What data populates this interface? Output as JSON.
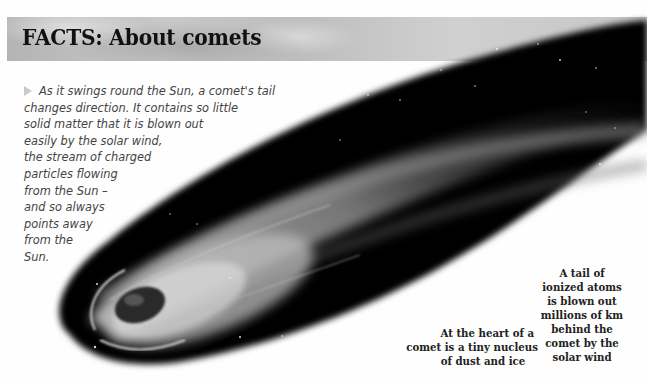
{
  "header": {
    "title": "FACTS: About comets"
  },
  "intro": {
    "marker_icon": "triangle-right-icon",
    "lines": [
      "As it swings round the Sun, a comet's tail",
      "changes direction. It contains so little",
      "solid matter that it is blown out",
      "easily by the solar wind,",
      "the stream of charged",
      "particles flowing",
      "from the Sun –",
      "and so always",
      "points away",
      "from the",
      "Sun."
    ]
  },
  "captions": {
    "nucleus": {
      "lines": [
        "At the heart of a",
        "comet is a tiny nucleus",
        "of dust and ice"
      ]
    },
    "tail": {
      "lines": [
        "A tail of",
        "ionized atoms",
        "is blown out",
        "millions of km",
        "behind the",
        "comet by the",
        "solar wind"
      ]
    }
  },
  "image": {
    "subject": "comet-illustration",
    "colors": {
      "space": "#000000",
      "tail_glow": "#bfbfbf",
      "background": "#fefefe"
    }
  }
}
